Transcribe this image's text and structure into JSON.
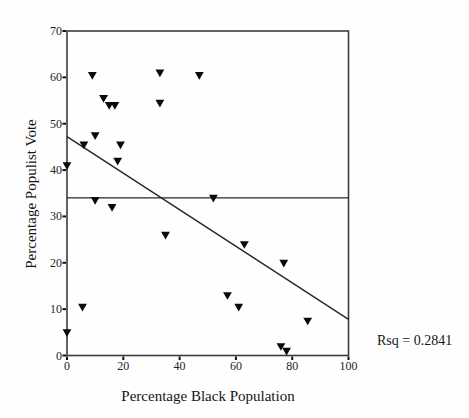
{
  "figure": {
    "background": "#fefefe",
    "frame_color": "#3c3c3c",
    "line_color": "#262626",
    "marker_color": "#0a0a0a",
    "marker_shape": "triangle-down"
  },
  "chart_data": {
    "type": "scatter",
    "title": "",
    "xlabel": "Percentage Black Population",
    "ylabel": "Percentage Populist Vote",
    "annotation": "Rsq = 0.2841",
    "xlim": [
      0,
      100
    ],
    "ylim": [
      0,
      70
    ],
    "xticks": [
      "0",
      "20",
      "40",
      "60",
      "80",
      "100"
    ],
    "yticks": [
      "0",
      "10",
      "20",
      "30",
      "40",
      "50",
      "60",
      "70"
    ],
    "grid": false,
    "legend": false,
    "points": [
      [
        9,
        60.5
      ],
      [
        33,
        61
      ],
      [
        47,
        60.5
      ],
      [
        13,
        55.5
      ],
      [
        15,
        54
      ],
      [
        17,
        54
      ],
      [
        33,
        54.5
      ],
      [
        10,
        47.5
      ],
      [
        6,
        45.5
      ],
      [
        19,
        45.5
      ],
      [
        18,
        42
      ],
      [
        0,
        41
      ],
      [
        10,
        33.5
      ],
      [
        16,
        32
      ],
      [
        52,
        34
      ],
      [
        35,
        26
      ],
      [
        63,
        24
      ],
      [
        77,
        20
      ],
      [
        57,
        13
      ],
      [
        5.5,
        10.5
      ],
      [
        61,
        10.5
      ],
      [
        85.5,
        7.5
      ],
      [
        0,
        5
      ],
      [
        76,
        2
      ],
      [
        78,
        1
      ]
    ],
    "mean_line_y": 34,
    "regression_line": {
      "x": [
        0,
        100
      ],
      "y": [
        47.2,
        7.8
      ]
    }
  }
}
